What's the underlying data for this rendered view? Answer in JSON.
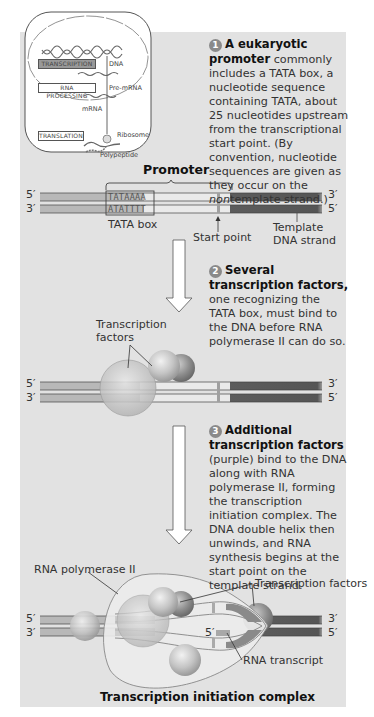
{
  "inset": {
    "boxes": [
      "TRANSCRIPTION",
      "RNA PROCESSING",
      "TRANSLATION"
    ],
    "labels": {
      "dna": "DNA",
      "pre_mrna": "Pre-mRNA",
      "mrna": "mRNA",
      "ribosome": "Ribosome",
      "polypeptide": "Polypeptide"
    }
  },
  "step1": {
    "number": "1",
    "title": "A eukaryotic promoter",
    "text_a": " commonly includes a TATA box, a nucleotide sequence containing TATA, about 25 nucleotides upstream from the transcriptional start point. (By convention, nucleotide sequences are given as they occur on the ",
    "text_italic": "non",
    "text_b": "template strand.)"
  },
  "step2": {
    "number": "2",
    "title": "Several transcription factors,",
    "text": " one recognizing the TATA box, must bind to the DNA before RNA polymerase II can do so."
  },
  "step3": {
    "number": "3",
    "title": "Additional transcription factors",
    "text": " (purple) bind to the DNA along with RNA polymerase II, forming the transcription initiation complex. The DNA double helix then unwinds, and RNA synthesis begins at the start point on the template strand."
  },
  "diagram1": {
    "promoter_label": "Promoter",
    "top_seq": "TATAAAA",
    "bottom_seq": "ATATTTT",
    "tata_box_label": "TATA box",
    "start_point_label": "Start point",
    "template_label_line1": "Template",
    "template_label_line2": "DNA strand",
    "left_top": "5′",
    "left_bottom": "3′",
    "right_top": "3′",
    "right_bottom": "5′"
  },
  "diagram2": {
    "tf_label_line1": "Transcription",
    "tf_label_line2": "factors",
    "left_top": "5′",
    "left_bottom": "3′",
    "right_top": "3′",
    "right_bottom": "5′"
  },
  "diagram3": {
    "rna_pol_label": "RNA polymerase II",
    "tf_label": "Transcription factors",
    "rna_transcript_label": "RNA transcript",
    "transcript_5prime": "5′",
    "left_top": "5′",
    "left_bottom": "3′",
    "right_top": "3′",
    "right_bottom": "5′",
    "caption": "Transcription initiation complex"
  },
  "colors": {
    "panel_bg": "#e2e2e2",
    "dna_light": "#c9c9c9",
    "dna_mid": "#a9a9a9",
    "dna_dark": "#5a5a5a",
    "protein_light": "#d6d6d6",
    "protein_dark": "#9c9c9c"
  }
}
